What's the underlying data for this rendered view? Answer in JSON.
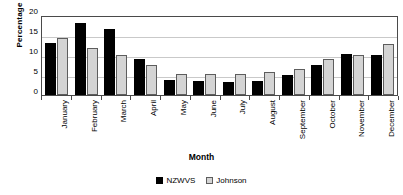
{
  "chart_data": {
    "type": "bar",
    "title": "",
    "xlabel": "Month",
    "ylabel": "Percentage",
    "ylim": [
      0,
      20
    ],
    "yticks": [
      0,
      5,
      10,
      15,
      20
    ],
    "grid": true,
    "legend_position": "bottom",
    "categories": [
      "January",
      "February",
      "March",
      "April",
      "May",
      "June",
      "July",
      "August",
      "September",
      "October",
      "November",
      "December"
    ],
    "series": [
      {
        "name": "NZWVS",
        "color": "#000000",
        "values": [
          13.0,
          18.0,
          16.5,
          9.0,
          3.8,
          3.5,
          3.3,
          3.5,
          5.1,
          7.4,
          10.2,
          10.1
        ]
      },
      {
        "name": "Johnson",
        "color": "#d4d4d4",
        "values": [
          14.3,
          11.8,
          9.9,
          7.5,
          5.2,
          5.2,
          5.2,
          5.8,
          6.6,
          9.1,
          9.9,
          12.8
        ]
      }
    ]
  }
}
